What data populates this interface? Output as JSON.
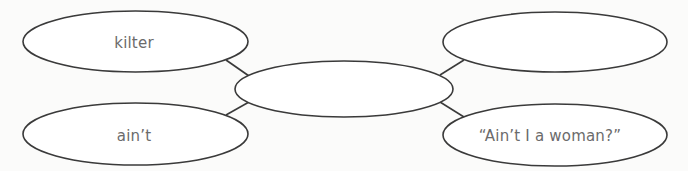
{
  "diagram": {
    "type": "concept-web",
    "colors": {
      "background": "#fbfbfa",
      "outline": "#3a3a3a",
      "text": "#6b6b6b",
      "fill": "#ffffff"
    },
    "center": {
      "label": ""
    },
    "nodes": [
      {
        "position": "top-left",
        "label": "kilter"
      },
      {
        "position": "top-right",
        "label": ""
      },
      {
        "position": "bottom-left",
        "label": "ain’t"
      },
      {
        "position": "bottom-right",
        "label": "“Ain’t I a woman?”"
      }
    ]
  }
}
